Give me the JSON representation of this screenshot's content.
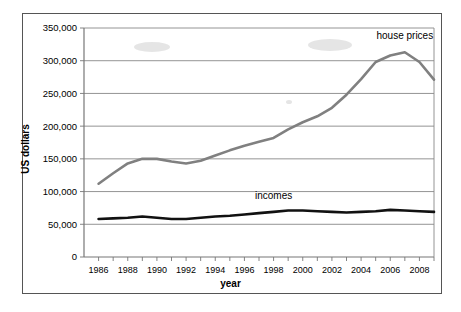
{
  "chart_data": {
    "type": "line",
    "title": "",
    "xlabel": "year",
    "ylabel": "US dollars",
    "xlim": [
      1985,
      2009
    ],
    "ylim": [
      0,
      350000
    ],
    "grid": true,
    "legend_position": "inline-annotations",
    "y_ticks": [
      "0",
      "50,000",
      "100,000",
      "150,000",
      "200,000",
      "250,000",
      "300,000",
      "350,000"
    ],
    "y_tick_values": [
      0,
      50000,
      100000,
      150000,
      200000,
      250000,
      300000,
      350000
    ],
    "x_ticks": [
      "1986",
      "1988",
      "1990",
      "1992",
      "1994",
      "1996",
      "1998",
      "2000",
      "2002",
      "2004",
      "2006",
      "2008"
    ],
    "x_tick_values": [
      1986,
      1988,
      1990,
      1992,
      1994,
      1996,
      1998,
      2000,
      2002,
      2004,
      2006,
      2008
    ],
    "x": [
      1986,
      1987,
      1988,
      1989,
      1990,
      1991,
      1992,
      1993,
      1994,
      1995,
      1996,
      1997,
      1998,
      1999,
      2000,
      2001,
      2002,
      2003,
      2004,
      2005,
      2006,
      2007,
      2008,
      2009
    ],
    "series": [
      {
        "name": "house prices",
        "color": "#808080",
        "values": [
          112000,
          128000,
          143000,
          150000,
          150000,
          146000,
          143000,
          147000,
          155000,
          163000,
          170000,
          176000,
          182000,
          195000,
          206000,
          215000,
          228000,
          248000,
          272000,
          298000,
          308000,
          313000,
          298000,
          271000
        ]
      },
      {
        "name": "incomes",
        "color": "#111111",
        "values": [
          58000,
          59000,
          60000,
          62000,
          60000,
          58000,
          58000,
          60000,
          62000,
          63000,
          65000,
          67000,
          69000,
          71000,
          71000,
          70000,
          69000,
          68000,
          69000,
          70000,
          72000,
          71000,
          70000,
          69000
        ]
      }
    ],
    "annotations": [
      {
        "text": "house prices",
        "x": 2007,
        "y": 333000
      },
      {
        "text": "incomes",
        "x": 1998,
        "y": 88000
      }
    ]
  }
}
